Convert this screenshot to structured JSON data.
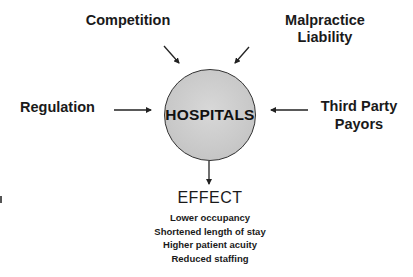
{
  "diagram": {
    "center": {
      "label": "HOSPITALS",
      "fill": "#c9c9c9"
    },
    "influences": [
      {
        "id": "competition",
        "label": "Competition",
        "position": "top-left"
      },
      {
        "id": "malpractice",
        "label_lines": [
          "Malpractice",
          "Liability"
        ],
        "position": "top-right"
      },
      {
        "id": "regulation",
        "label": "Regulation",
        "position": "left"
      },
      {
        "id": "third_party",
        "label_lines": [
          "Third Party",
          "Payors"
        ],
        "position": "right"
      }
    ],
    "effect": {
      "title": "EFFECT",
      "items": [
        "Lower occupancy",
        "Shortened length of stay",
        "Higher patient acuity",
        "Reduced staffing"
      ]
    }
  }
}
